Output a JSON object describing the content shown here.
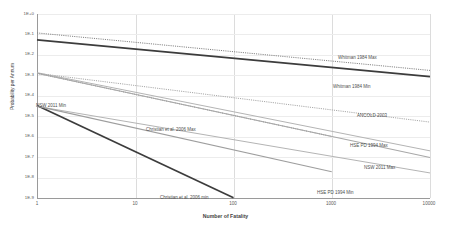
{
  "chart_data": {
    "type": "line",
    "title": "",
    "xlabel": "Number of Fatality",
    "ylabel": "Probability per Annum",
    "xscale": "log",
    "yscale": "log",
    "xlim": [
      1,
      10000
    ],
    "ylim": [
      1e-09,
      1
    ],
    "grid": true,
    "legend_position": "inline-annotations",
    "xticks": [
      "1",
      "10",
      "100",
      "1000",
      "10000"
    ],
    "xtick_values": [
      1,
      10,
      100,
      1000,
      10000
    ],
    "yticks": [
      "1E+0",
      "1E-1",
      "1E-2",
      "1E-3",
      "1E-4",
      "1E-5",
      "1E-6",
      "1E-7",
      "1E-8",
      "1E-9"
    ],
    "ytick_values": [
      1,
      0.1,
      0.01,
      0.001,
      0.0001,
      1e-05,
      1e-06,
      1e-07,
      1e-08,
      1e-09
    ],
    "series": [
      {
        "name": "Whitman 1984 Max",
        "style": "dotted",
        "color": "#808080",
        "width": 1.0,
        "x": [
          1,
          10000
        ],
        "y": [
          0.12,
          0.0018
        ]
      },
      {
        "name": "Whitman 1984 Min",
        "style": "solid",
        "color": "#3c3c3c",
        "width": 1.9,
        "x": [
          1,
          10000
        ],
        "y": [
          0.055,
          0.0009
        ]
      },
      {
        "name": "ANCOLD 2003",
        "style": "dotted",
        "color": "#9a9a9a",
        "width": 0.9,
        "x": [
          1,
          10000
        ],
        "y": [
          0.0013,
          5.5e-06
        ]
      },
      {
        "name": "NSW 2011 Min",
        "style": "solid",
        "color": "#b4b4b4",
        "width": 1.0,
        "x": [
          1,
          10000
        ],
        "y": [
          0.0014,
          2.2e-07
        ]
      },
      {
        "name": "NSW 2011 Max",
        "style": "solid",
        "color": "#b4b4b4",
        "width": 1.0,
        "x": [
          1,
          10000
        ],
        "y": [
          3.2e-05,
          1.85e-08
        ]
      },
      {
        "name": "Christian et al. 2006 Max",
        "style": "dotted",
        "color": "#787878",
        "width": 0.9,
        "x": [
          1,
          1000
        ],
        "y": [
          0.0013,
          1.1e-06
        ]
      },
      {
        "name": "Christian et al. 2006 min",
        "style": "solid",
        "color": "#3c3c3c",
        "width": 1.7,
        "x": [
          1,
          100
        ],
        "y": [
          3.5e-05,
          1.15e-09
        ]
      },
      {
        "name": "HSE PD 1994 Max",
        "style": "solid",
        "color": "#a8a8a8",
        "width": 1.1,
        "x": [
          1,
          10000
        ],
        "y": [
          0.0013,
          1.05e-07
        ]
      },
      {
        "name": "HSE PD 1994 Min",
        "style": "solid",
        "color": "#9e9e9e",
        "width": 1.1,
        "x": [
          1,
          1000
        ],
        "y": [
          3.3e-05,
          2.1e-08
        ]
      }
    ],
    "annotations": [
      {
        "text": "Whitman 1984 Max",
        "x_px": 338,
        "y_px": 56
      },
      {
        "text": "Whitman 1984 Min",
        "x_px": 333,
        "y_px": 85
      },
      {
        "text": "ANCOLD 2003",
        "x_px": 357,
        "y_px": 114
      },
      {
        "text": "NSW 2011 Min",
        "x_px": 36,
        "y_px": 104
      },
      {
        "text": "NSW 2011 Max",
        "x_px": 364,
        "y_px": 166
      },
      {
        "text": "Christian et al. 2006 Max",
        "x_px": 146,
        "y_px": 128
      },
      {
        "text": "Christian et al. 2006 min",
        "x_px": 160,
        "y_px": 196
      },
      {
        "text": "HSE PD 1994 Max",
        "x_px": 350,
        "y_px": 144
      },
      {
        "text": "HSE PD 1994 Min",
        "x_px": 317,
        "y_px": 191
      }
    ]
  }
}
